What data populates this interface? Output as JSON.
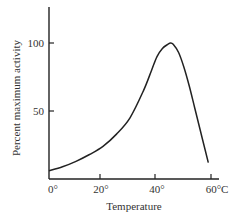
{
  "chart_data": {
    "type": "line",
    "title": "",
    "xlabel": "Temperature",
    "ylabel": "Percent maximum activity",
    "x_ticks": [
      "0°",
      "20°",
      "40°",
      "60°C"
    ],
    "x_tick_values": [
      0,
      20,
      40,
      60
    ],
    "y_ticks": [
      "50",
      "100"
    ],
    "y_tick_values": [
      50,
      100
    ],
    "xlim": [
      0,
      62
    ],
    "ylim": [
      0,
      126
    ],
    "grid": false,
    "legend": null,
    "series": [
      {
        "name": "Enzyme activity",
        "x": [
          0,
          5,
          10,
          15,
          20,
          25,
          30,
          35,
          38,
          40,
          42,
          44,
          45,
          46,
          48,
          50,
          52,
          54,
          56,
          58,
          59
        ],
        "y": [
          6,
          9,
          13,
          18,
          24,
          33,
          45,
          65,
          80,
          90,
          96,
          99,
          100,
          99,
          93,
          82,
          68,
          52,
          36,
          20,
          12
        ]
      }
    ],
    "annotations": []
  }
}
